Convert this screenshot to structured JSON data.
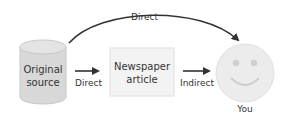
{
  "nodes": {
    "source": {
      "line1": "Original",
      "line2": "source"
    },
    "article": {
      "line1": "Newspaper",
      "line2": "article"
    },
    "you": {
      "label": "You"
    }
  },
  "edges": {
    "top": {
      "label": "Direct"
    },
    "source_to_article": {
      "label": "Direct"
    },
    "article_to_you": {
      "label": "Indirect"
    }
  },
  "colors": {
    "cylinder_fill": "#d8d8d8",
    "cylinder_stroke": "#c4c4c4",
    "box_fill": "#f3f3f3",
    "box_stroke": "#dedede",
    "face_fill": "#ececec",
    "arrow": "#333333"
  }
}
